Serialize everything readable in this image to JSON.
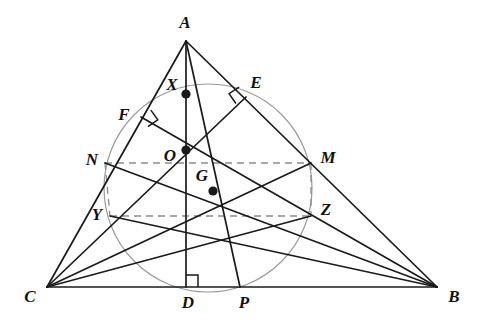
{
  "figure": {
    "type": "euler-line-nine-point-circle-diagram",
    "width": 483,
    "height": 329,
    "background": "#ffffff",
    "stroke_color": "#1a1a1a",
    "circle_color": "#9a9a9a",
    "dash_color": "#8c8c8c"
  },
  "points": {
    "A": {
      "label": "A",
      "x": 186,
      "y": 41,
      "lx": 185,
      "ly": 22
    },
    "B": {
      "label": "B",
      "x": 437,
      "y": 287,
      "lx": 454,
      "ly": 296
    },
    "C": {
      "label": "C",
      "x": 47,
      "y": 287,
      "lx": 30,
      "ly": 296
    },
    "D": {
      "label": "D",
      "x": 186,
      "y": 287,
      "lx": 188,
      "ly": 302
    },
    "P": {
      "label": "P",
      "x": 240,
      "y": 287,
      "lx": 244,
      "ly": 302
    },
    "E": {
      "label": "E",
      "x": 246,
      "y": 97,
      "lx": 256,
      "ly": 82
    },
    "F": {
      "label": "F",
      "x": 141,
      "y": 117,
      "lx": 124,
      "ly": 114
    },
    "M": {
      "label": "M",
      "x": 311,
      "y": 163,
      "lx": 328,
      "ly": 157
    },
    "N": {
      "label": "N",
      "x": 105,
      "y": 163,
      "lx": 92,
      "ly": 159
    },
    "Y": {
      "label": "Y",
      "x": 110,
      "y": 216,
      "lx": 97,
      "ly": 214
    },
    "Z": {
      "label": "Z",
      "x": 311,
      "y": 216,
      "lx": 326,
      "ly": 209
    },
    "X": {
      "label": "X",
      "x": 186,
      "y": 94,
      "lx": 172,
      "ly": 84
    },
    "O": {
      "label": "O",
      "x": 186,
      "y": 150,
      "lx": 170,
      "ly": 155
    },
    "G": {
      "label": "G",
      "x": 213,
      "y": 191,
      "lx": 202,
      "ly": 175
    }
  },
  "marked_points": [
    {
      "name": "X",
      "x": 186,
      "y": 94
    },
    {
      "name": "O",
      "x": 186,
      "y": 150
    },
    {
      "name": "G",
      "x": 213,
      "y": 191
    }
  ],
  "circle": {
    "name": "nine-point-circle",
    "cx": 208,
    "cy": 188,
    "r": 104
  },
  "right_angles": [
    {
      "name": "right-angle-at-D",
      "x": 186,
      "y": 287,
      "ux": 0,
      "uy": -1,
      "vx": 1,
      "vy": 0,
      "size": 12
    },
    {
      "name": "right-angle-at-F",
      "x": 141,
      "y": 117,
      "ux": 0.82,
      "uy": -0.57,
      "vx": 0.58,
      "vy": 0.81,
      "size": 12
    },
    {
      "name": "right-angle-at-E",
      "x": 246,
      "y": 97,
      "ux": -0.84,
      "uy": 0.54,
      "vx": -0.57,
      "vy": -0.82,
      "size": 12
    }
  ],
  "solid_segments": [
    {
      "name": "side-CB",
      "from": "C",
      "to": "B"
    },
    {
      "name": "side-CA",
      "from": "C",
      "to": "A"
    },
    {
      "name": "side-AB",
      "from": "A",
      "to": "B"
    },
    {
      "name": "altitude-AD",
      "from": "A",
      "to": "D"
    },
    {
      "name": "cevian-AP",
      "from": "A",
      "to": "P"
    },
    {
      "name": "altitude-BF",
      "from": "B",
      "to": "F"
    },
    {
      "name": "altitude-CE",
      "from": "C",
      "to": "E"
    },
    {
      "name": "median-CM",
      "from": "C",
      "to": "M"
    },
    {
      "name": "median-BN",
      "from": "B",
      "to": "N"
    },
    {
      "name": "segment-CZ",
      "from": "C",
      "to": "Z"
    },
    {
      "name": "segment-BY",
      "from": "B",
      "to": "Y"
    }
  ],
  "dashed_segments": [
    {
      "name": "dashed-NM",
      "from": "N",
      "to": "M"
    },
    {
      "name": "dashed-YZ",
      "from": "Y",
      "to": "Z"
    },
    {
      "name": "dashed-NY",
      "from": "N",
      "to": "Y"
    },
    {
      "name": "dashed-MZ",
      "from": "M",
      "to": "Z"
    }
  ],
  "labels_order": [
    "A",
    "E",
    "X",
    "F",
    "N",
    "O",
    "M",
    "G",
    "Y",
    "Z",
    "C",
    "D",
    "P",
    "B"
  ]
}
